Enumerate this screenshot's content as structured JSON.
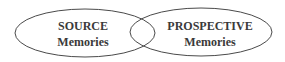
{
  "diagram": {
    "type": "venn",
    "sets": [
      {
        "id": "source",
        "line1": "SOURCE",
        "line2": "Memories"
      },
      {
        "id": "prospective",
        "line1": "PROSPECTIVE",
        "line2": "Memories"
      }
    ],
    "colors": {
      "stroke": "#4a4a4a",
      "text": "#3a3a3a",
      "background": "#ffffff"
    }
  }
}
